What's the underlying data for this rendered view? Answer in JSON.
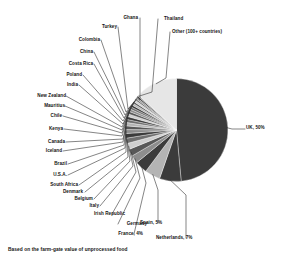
{
  "caption": "Based on the farm-gate value of unprocessed food",
  "chart_data": {
    "type": "pie",
    "title": "",
    "xlabel": "",
    "ylabel": "",
    "legend_position": "none",
    "grid": false,
    "note": "Based on the farm-gate value of unprocessed food",
    "units": "percent",
    "categories": [
      "UK",
      "Netherlands",
      "Spain",
      "France",
      "Germany",
      "Irish Republic",
      "Italy",
      "Belgium",
      "Denmark",
      "South Africa",
      "U.S.A.",
      "Brazil",
      "Iceland",
      "Canada",
      "Kenya",
      "Chile",
      "Mauritius",
      "New Zealand",
      "India",
      "Poland",
      "Costa Rica",
      "China",
      "Colombia",
      "Turkey",
      "Ghana",
      "Thailand",
      "Other (100+ countries)"
    ],
    "values": [
      50,
      7,
      5,
      4,
      2.6,
      2.3,
      2.0,
      1.7,
      1.5,
      1.3,
      1.2,
      1.1,
      1.0,
      0.95,
      0.9,
      0.85,
      0.8,
      0.75,
      0.7,
      0.65,
      0.6,
      0.6,
      0.55,
      0.5,
      0.5,
      0.45,
      13.5
    ],
    "labeled_slices": [
      {
        "name": "UK",
        "label": "UK, 50%",
        "value": 50
      },
      {
        "name": "Netherlands",
        "label": "Netherlands, 7%",
        "value": 7
      },
      {
        "name": "Spain",
        "label": "Spain, 5%",
        "value": 5
      },
      {
        "name": "France",
        "label": "France, 4%",
        "value": 4
      },
      {
        "name": "Other",
        "label": "Other (100+ countries)",
        "value": 13.5
      }
    ]
  },
  "labels": {
    "uk": "UK, 50%",
    "netherlands": "Netherlands, 7%",
    "spain": "Spain, 5%",
    "france": "France, 4%",
    "germany": "Germany",
    "irish_republic": "Irish Republic",
    "italy": "Italy",
    "belgium": "Belgium",
    "denmark": "Denmark",
    "south_africa": "South Africa",
    "usa": "U.S.A.",
    "brazil": "Brazil",
    "iceland": "Iceland",
    "canada": "Canada",
    "kenya": "Kenya",
    "chile": "Chile",
    "mauritius": "Mauritius",
    "new_zealand": "New Zealand",
    "india": "India",
    "poland": "Poland",
    "costa_rica": "Costa Rica",
    "china": "China",
    "colombia": "Colombia",
    "turkey": "Turkey",
    "ghana": "Ghana",
    "thailand": "Thailand",
    "other": "Other (100+ countries)"
  },
  "colors": {
    "dark": "#3b3b3b",
    "mid_dark": "#585858",
    "mid": "#6f6f6f",
    "mid_light": "#8d8d8d",
    "light": "#b4b4b4",
    "lighter": "#cfcfcf",
    "lightest": "#e6e6e6",
    "line": "#333333",
    "text": "#141414",
    "background": "#ffffff"
  }
}
